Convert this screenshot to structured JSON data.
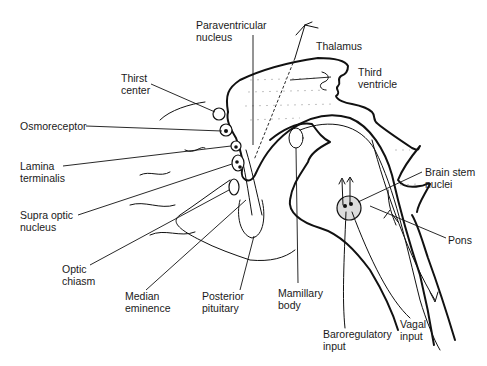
{
  "diagram": {
    "type": "anatomical line drawing",
    "background": "#ffffff",
    "ink": "#111111"
  },
  "labels": {
    "paraventricular": "Paraventricular\nnucleus",
    "thalamus": "Thalamus",
    "third_ventricle": "Third\nventricle",
    "thirst_center": "Thirst\ncenter",
    "osmoreceptor": "Osmoreceptor",
    "lamina_terminalis": "Lamina\nterminalis",
    "supra_optic": "Supra optic\nnucleus",
    "optic_chiasm": "Optic\nchiasm",
    "median_eminence": "Median\neminence",
    "posterior_pituitary": "Posterior\npituitary",
    "mamillary_body": "Mamillary\nbody",
    "brain_stem_nuclei": "Brain stem\nnuclei",
    "pons": "Pons",
    "baroregulatory_input": "Baroregulatory\ninput",
    "vagal_input": "Vagal\ninput"
  }
}
